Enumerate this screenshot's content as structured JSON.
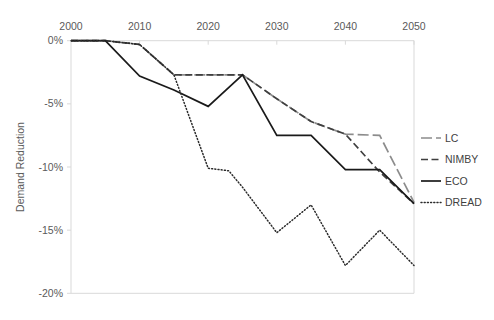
{
  "chart_data": {
    "type": "line",
    "title": "",
    "xlabel": "",
    "ylabel": "Demand Reduction",
    "xlim": [
      2000,
      2050
    ],
    "ylim": [
      -20,
      0
    ],
    "xticks": [
      2000,
      2010,
      2020,
      2030,
      2040,
      2050
    ],
    "xtick_labels": [
      "2000",
      "2010",
      "2020",
      "2030",
      "2040",
      "2050"
    ],
    "yticks": [
      0,
      -5,
      -10,
      -15,
      -20
    ],
    "ytick_labels": [
      "0%",
      "-5%",
      "-10%",
      "-15%",
      "-20%"
    ],
    "grid": false,
    "legend_position": "right",
    "series": [
      {
        "name": "LC",
        "style": "long-dash",
        "color": "#8c8c8c",
        "x": [
          2000,
          2005,
          2010,
          2015,
          2020,
          2025,
          2030,
          2035,
          2040,
          2045,
          2050
        ],
        "y": [
          0,
          0,
          -0.3,
          -2.7,
          -2.7,
          -2.7,
          -4.6,
          -6.4,
          -7.4,
          -7.5,
          -12.8
        ]
      },
      {
        "name": "NIMBY",
        "style": "dash",
        "color": "#3f3f3f",
        "x": [
          2000,
          2005,
          2010,
          2015,
          2020,
          2025,
          2030,
          2035,
          2040,
          2045,
          2050
        ],
        "y": [
          0,
          0,
          -0.3,
          -2.7,
          -2.7,
          -2.7,
          -4.6,
          -6.4,
          -7.4,
          -10.4,
          -12.9
        ]
      },
      {
        "name": "ECO",
        "style": "solid",
        "color": "#1a1a1a",
        "x": [
          2000,
          2005,
          2010,
          2015,
          2020,
          2025,
          2030,
          2035,
          2040,
          2045,
          2050
        ],
        "y": [
          0,
          0,
          -2.8,
          -3.9,
          -5.2,
          -2.7,
          -7.5,
          -7.5,
          -10.2,
          -10.2,
          -12.9
        ]
      },
      {
        "name": "DREAD",
        "style": "dotted",
        "color": "#2b2b2b",
        "x": [
          2000,
          2005,
          2010,
          2015,
          2020,
          2023,
          2025,
          2030,
          2035,
          2040,
          2045,
          2050
        ],
        "y": [
          0,
          0,
          -0.3,
          -2.7,
          -10.1,
          -10.3,
          -11.6,
          -15.2,
          -13.0,
          -17.8,
          -15.0,
          -17.8
        ]
      }
    ]
  },
  "legend": {
    "items": [
      {
        "label": "LC"
      },
      {
        "label": "NIMBY"
      },
      {
        "label": "ECO"
      },
      {
        "label": "DREAD"
      }
    ]
  },
  "colors": {
    "lc": "#8c8c8c",
    "nimby": "#3f3f3f",
    "eco": "#1a1a1a",
    "dread": "#2b2b2b",
    "frame": "#d9d9d9",
    "text": "#5a5a5a"
  }
}
